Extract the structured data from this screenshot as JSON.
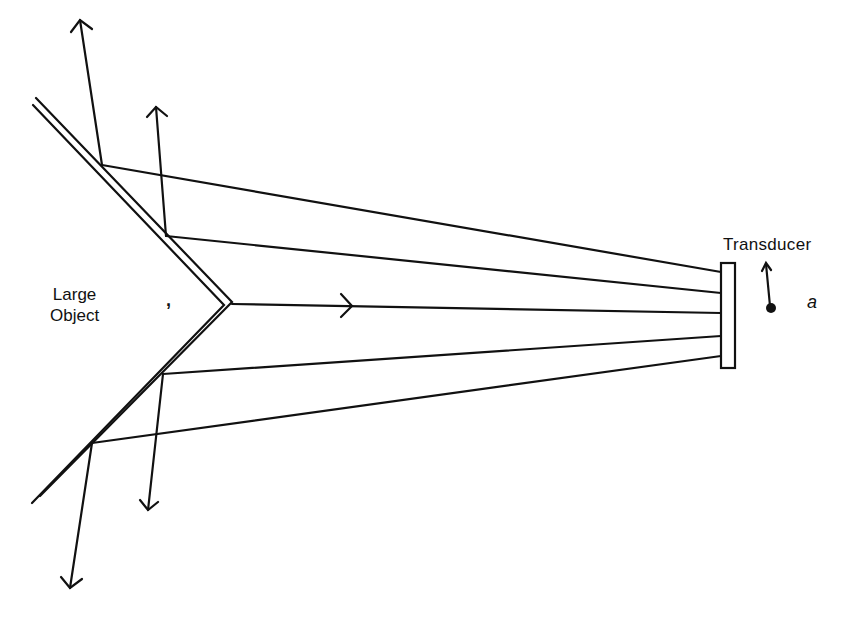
{
  "diagram": {
    "type": "ultrasound reflection geometry",
    "labels": {
      "object": [
        "Large",
        "Object"
      ],
      "transducer": "Transducer",
      "point": "a",
      "apex_mark": ","
    },
    "elements": {
      "object_surface": "V-shaped double-line boundary with apex pointing toward transducer",
      "transducer": "narrow vertical rectangle at right",
      "rays": [
        {
          "from": "surface upper-far",
          "to": "transducer top",
          "reflected": "upward arrow"
        },
        {
          "from": "surface upper-near",
          "to": "transducer upper",
          "reflected": "upward arrow"
        },
        {
          "from": "apex",
          "to": "transducer center",
          "reflected": "returns to transducer (arrow toward transducer)"
        },
        {
          "from": "surface lower-near",
          "to": "transducer lower",
          "reflected": "downward arrow"
        },
        {
          "from": "surface lower-far",
          "to": "transducer bottom",
          "reflected": "downward arrow"
        }
      ],
      "point_a": "small filled dot to right of transducer with upward arrow"
    },
    "colors": {
      "ink": "#111111",
      "background": "#ffffff"
    }
  }
}
